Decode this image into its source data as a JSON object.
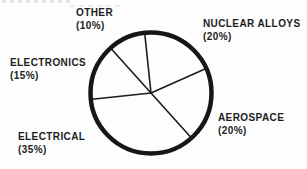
{
  "chart_data": {
    "type": "pie",
    "title": "",
    "legend": "none",
    "labels_position": "outside",
    "start_angle_deg": -6,
    "direction": "clockwise",
    "slices": [
      {
        "label": "NUCLEAR ALLOYS",
        "value": 20,
        "pct_label": "(20%)",
        "label_side": "top-right"
      },
      {
        "label": "AEROSPACE",
        "value": 20,
        "pct_label": "(20%)",
        "label_side": "bottom-right"
      },
      {
        "label": "ELECTRICAL",
        "value": 35,
        "pct_label": "(35%)",
        "label_side": "bottom-left"
      },
      {
        "label": "ELECTRONICS",
        "value": 15,
        "pct_label": "(15%)",
        "label_side": "left"
      },
      {
        "label": "OTHER",
        "value": 10,
        "pct_label": "(10%)",
        "label_side": "top-left"
      }
    ],
    "style": {
      "slice_fill": "#fdfdfd",
      "outline_color": "#161616",
      "outline_width_px": 4.5,
      "divider_color": "#1c1c1c",
      "divider_width_px": 1.6,
      "label_color": "#1e1e1e",
      "background": "#fdfdfd"
    }
  }
}
